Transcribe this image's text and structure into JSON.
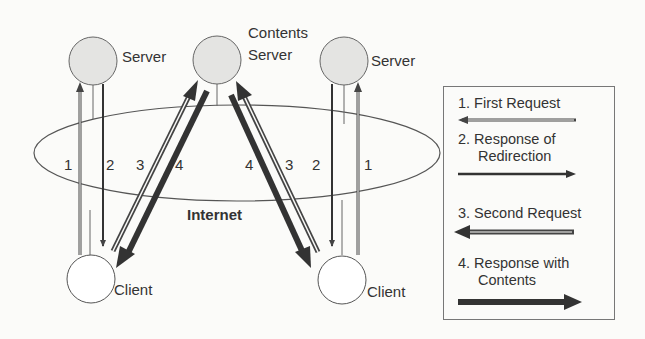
{
  "diagram": {
    "nodes": {
      "left_server": {
        "label": "Server"
      },
      "contents_server": {
        "label_line1": "Contents",
        "label_line2": "Server"
      },
      "right_server": {
        "label": "Server"
      },
      "left_client": {
        "label": "Client"
      },
      "right_client": {
        "label": "Client"
      },
      "internet": {
        "label": "Internet"
      }
    },
    "edge_labels": {
      "left": [
        "1",
        "2",
        "3",
        "4"
      ],
      "right": [
        "4",
        "3",
        "2",
        "1"
      ]
    },
    "legend": {
      "items": [
        {
          "line1": "1. First Request",
          "line2": "",
          "arrow": "left",
          "style": "thin-double"
        },
        {
          "line1": "2. Response of",
          "line2": "Redirection",
          "arrow": "right",
          "style": "thin-solid"
        },
        {
          "line1": "3. Second Request",
          "line2": "",
          "arrow": "left",
          "style": "thick-double"
        },
        {
          "line1": "4. Response with",
          "line2": "Contents",
          "arrow": "right",
          "style": "thick-solid"
        }
      ]
    },
    "colors": {
      "line": "#444444",
      "server_fill": "#e4e4e2",
      "client_fill": "#ffffff",
      "thick_arrow": "#333333"
    }
  }
}
